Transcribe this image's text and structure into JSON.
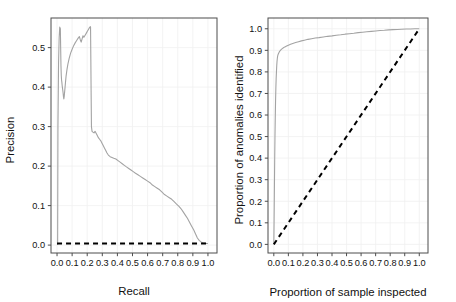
{
  "figure": {
    "background_color": "#ffffff",
    "panel_border_color": "#4d4d4d",
    "grid_color": "#f0f0f0",
    "curve_color": "#a3a3a3",
    "reference_color": "#000000"
  },
  "panels": [
    {
      "id": "precision-recall",
      "xlabel": "Recall",
      "ylabel": "Precision",
      "xticks": [
        "0.0",
        "0.1",
        "0.2",
        "0.3",
        "0.4",
        "0.5",
        "0.6",
        "0.7",
        "0.8",
        "0.9",
        "1.0"
      ],
      "yticks": [
        "0.0",
        "0.1",
        "0.2",
        "0.3",
        "0.4",
        "0.5"
      ]
    },
    {
      "id": "lift-curve",
      "xlabel": "Proportion of sample inspected",
      "ylabel": "Proportion of anomalies identified",
      "xticks": [
        "0.0",
        "0.1",
        "0.2",
        "0.3",
        "0.4",
        "0.5",
        "0.6",
        "0.7",
        "0.8",
        "0.9",
        "1.0"
      ],
      "yticks": [
        "0.0",
        "0.1",
        "0.2",
        "0.3",
        "0.4",
        "0.5",
        "0.6",
        "0.7",
        "0.8",
        "0.9",
        "1.0"
      ]
    }
  ],
  "chart_data": [
    {
      "type": "line",
      "id": "precision-recall",
      "title": "",
      "xlabel": "Recall",
      "ylabel": "Precision",
      "xlim": [
        -0.04,
        1.06
      ],
      "ylim": [
        -0.02,
        0.575
      ],
      "xticks": [
        0.0,
        0.1,
        0.2,
        0.3,
        0.4,
        0.5,
        0.6,
        0.7,
        0.8,
        0.9,
        1.0
      ],
      "yticks": [
        0.0,
        0.1,
        0.2,
        0.3,
        0.4,
        0.5
      ],
      "grid": true,
      "legend": "none",
      "series": [
        {
          "name": "Precision-recall curve",
          "color": "#a3a3a3",
          "style": "solid",
          "x": [
            0.004,
            0.006,
            0.01,
            0.014,
            0.018,
            0.022,
            0.024,
            0.026,
            0.028,
            0.03,
            0.032,
            0.034,
            0.036,
            0.038,
            0.04,
            0.042,
            0.045,
            0.048,
            0.052,
            0.056,
            0.06,
            0.066,
            0.072,
            0.08,
            0.09,
            0.1,
            0.11,
            0.12,
            0.13,
            0.14,
            0.148,
            0.154,
            0.16,
            0.166,
            0.172,
            0.178,
            0.184,
            0.19,
            0.196,
            0.202,
            0.208,
            0.214,
            0.218,
            0.222,
            0.224,
            0.226,
            0.228,
            0.232,
            0.238,
            0.245,
            0.252,
            0.258,
            0.266,
            0.274,
            0.282,
            0.29,
            0.298,
            0.306,
            0.314,
            0.322,
            0.33,
            0.34,
            0.352,
            0.364,
            0.376,
            0.39,
            0.404,
            0.418,
            0.432,
            0.446,
            0.46,
            0.475,
            0.49,
            0.505,
            0.52,
            0.536,
            0.552,
            0.568,
            0.584,
            0.6,
            0.616,
            0.632,
            0.648,
            0.664,
            0.68,
            0.696,
            0.712,
            0.728,
            0.744,
            0.76,
            0.776,
            0.792,
            0.808,
            0.822,
            0.836,
            0.85,
            0.864,
            0.878,
            0.892,
            0.906,
            0.918,
            0.93,
            0.942,
            0.954,
            0.966,
            0.978,
            0.99,
            1.0
          ],
          "y": [
            0.0,
            0.3,
            0.46,
            0.525,
            0.552,
            0.548,
            0.5,
            0.455,
            0.43,
            0.418,
            0.412,
            0.404,
            0.398,
            0.392,
            0.386,
            0.378,
            0.37,
            0.378,
            0.395,
            0.412,
            0.428,
            0.445,
            0.458,
            0.472,
            0.486,
            0.496,
            0.505,
            0.512,
            0.518,
            0.524,
            0.528,
            0.52,
            0.514,
            0.522,
            0.53,
            0.526,
            0.53,
            0.534,
            0.538,
            0.542,
            0.546,
            0.55,
            0.552,
            0.553,
            0.47,
            0.38,
            0.3,
            0.288,
            0.286,
            0.284,
            0.288,
            0.284,
            0.278,
            0.272,
            0.268,
            0.264,
            0.258,
            0.252,
            0.246,
            0.24,
            0.234,
            0.228,
            0.224,
            0.222,
            0.22,
            0.218,
            0.214,
            0.21,
            0.206,
            0.202,
            0.198,
            0.194,
            0.19,
            0.186,
            0.182,
            0.178,
            0.174,
            0.17,
            0.166,
            0.162,
            0.158,
            0.152,
            0.148,
            0.144,
            0.14,
            0.134,
            0.128,
            0.124,
            0.12,
            0.116,
            0.11,
            0.104,
            0.098,
            0.092,
            0.084,
            0.076,
            0.068,
            0.058,
            0.048,
            0.038,
            0.028,
            0.018,
            0.012,
            0.008,
            0.006,
            0.005,
            0.004,
            0.004
          ]
        },
        {
          "name": "Baseline (zero precision)",
          "color": "#000000",
          "style": "dashed",
          "x": [
            0.0,
            1.0
          ],
          "y": [
            0.004,
            0.004
          ]
        }
      ]
    },
    {
      "type": "line",
      "id": "lift-curve",
      "title": "",
      "xlabel": "Proportion of sample inspected",
      "ylabel": "Proportion of anomalies identified",
      "xlim": [
        -0.04,
        1.06
      ],
      "ylim": [
        -0.04,
        1.05
      ],
      "xticks": [
        0.0,
        0.1,
        0.2,
        0.3,
        0.4,
        0.5,
        0.6,
        0.7,
        0.8,
        0.9,
        1.0
      ],
      "yticks": [
        0.0,
        0.1,
        0.2,
        0.3,
        0.4,
        0.5,
        0.6,
        0.7,
        0.8,
        0.9,
        1.0
      ],
      "grid": true,
      "legend": "none",
      "series": [
        {
          "name": "Cumulative anomalies identified",
          "color": "#a3a3a3",
          "style": "solid",
          "x": [
            0.0,
            0.002,
            0.004,
            0.006,
            0.008,
            0.01,
            0.012,
            0.014,
            0.016,
            0.018,
            0.02,
            0.022,
            0.024,
            0.026,
            0.028,
            0.03,
            0.034,
            0.038,
            0.044,
            0.05,
            0.058,
            0.066,
            0.076,
            0.088,
            0.1,
            0.115,
            0.13,
            0.15,
            0.17,
            0.19,
            0.21,
            0.235,
            0.26,
            0.285,
            0.31,
            0.34,
            0.37,
            0.4,
            0.43,
            0.46,
            0.49,
            0.52,
            0.55,
            0.58,
            0.61,
            0.64,
            0.67,
            0.7,
            0.73,
            0.76,
            0.79,
            0.82,
            0.85,
            0.88,
            0.91,
            0.94,
            0.97,
            1.0
          ],
          "y": [
            0.0,
            0.12,
            0.26,
            0.39,
            0.5,
            0.59,
            0.665,
            0.722,
            0.768,
            0.8,
            0.828,
            0.848,
            0.862,
            0.872,
            0.878,
            0.882,
            0.888,
            0.893,
            0.899,
            0.903,
            0.908,
            0.912,
            0.916,
            0.92,
            0.924,
            0.928,
            0.932,
            0.936,
            0.94,
            0.944,
            0.947,
            0.951,
            0.954,
            0.957,
            0.959,
            0.962,
            0.965,
            0.967,
            0.97,
            0.972,
            0.975,
            0.977,
            0.979,
            0.982,
            0.984,
            0.986,
            0.988,
            0.99,
            0.992,
            0.993,
            0.995,
            0.996,
            0.997,
            0.998,
            0.999,
            0.999,
            1.0,
            1.0
          ]
        },
        {
          "name": "Random baseline",
          "color": "#000000",
          "style": "dashed",
          "x": [
            0.0,
            1.0
          ],
          "y": [
            0.0,
            1.0
          ]
        }
      ]
    }
  ]
}
